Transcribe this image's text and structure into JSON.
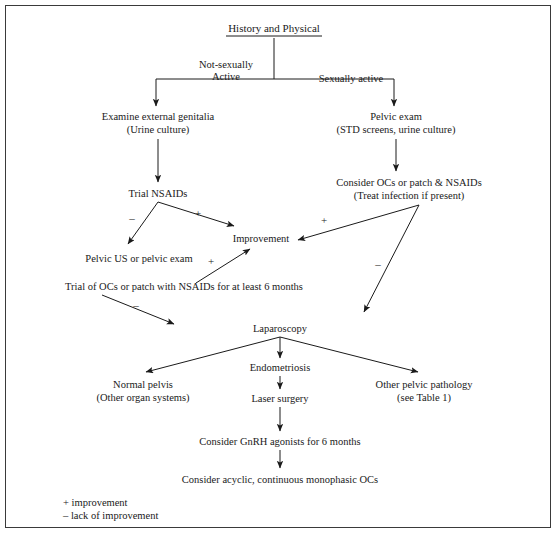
{
  "figure": {
    "type": "clinical-algorithm-flowchart",
    "border_color": "#3a3a3a",
    "background_color": "#ffffff",
    "text_color": "#1a1a1a"
  },
  "nodes": {
    "root": {
      "line1": "History and Physical",
      "underlined": true
    },
    "branch_label_left_l1": "Not-sexually",
    "branch_label_left_l2": "Active",
    "branch_label_right": "Sexually active",
    "exam_external": {
      "line1": "Examine external genitalia",
      "line2": "(Urine culture)"
    },
    "pelvic_exam": {
      "line1": "Pelvic exam",
      "line2": "(STD screens, urine culture)"
    },
    "trial_nsaids": {
      "line1": "Trial NSAIDs"
    },
    "consider_ocs": {
      "line1": "Consider OCs or patch & NSAIDs",
      "line2": "(Treat infection if present)"
    },
    "improvement": {
      "line1": "Improvement"
    },
    "pelvic_us": {
      "line1": "Pelvic US or pelvic exam"
    },
    "trial_ocs_patch": {
      "line1": "Trial of OCs or patch with NSAIDs for at least 6 months"
    },
    "laparoscopy": {
      "line1": "Laparoscopy"
    },
    "endometriosis": {
      "line1": "Endometriosis"
    },
    "normal_pelvis": {
      "line1": "Normal pelvis",
      "line2": "(Other organ systems)"
    },
    "laser_surgery": {
      "line1": "Laser surgery"
    },
    "other_pathology": {
      "line1": "Other pelvic pathology",
      "line2": "(see Table 1)"
    },
    "gnrh": {
      "line1": "Consider GnRH agonists for 6 months"
    },
    "monophasic": {
      "line1": "Consider acyclic, continuous monophasic OCs"
    }
  },
  "edge_labels": {
    "nsaids_negative": "–",
    "nsaids_positive": "+",
    "ocs_positive": "+",
    "ocs_negative": "–",
    "trial_ocs_positive": "+",
    "trial_ocs_negative": "–"
  },
  "legend": {
    "plus": "+ improvement",
    "minus": "– lack of improvement"
  }
}
